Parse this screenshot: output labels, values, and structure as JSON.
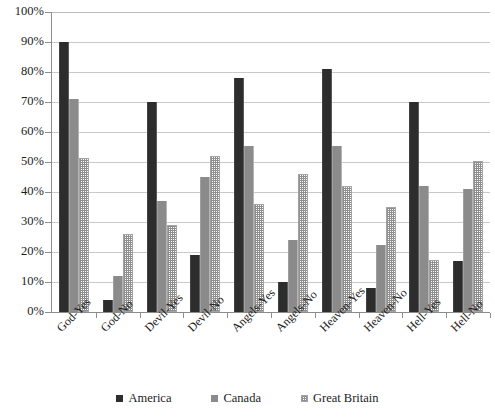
{
  "chart_data": {
    "type": "bar",
    "title": "",
    "subtitle": "",
    "xlabel": "",
    "ylabel": "",
    "ylim": [
      0,
      100
    ],
    "y_unit": "%",
    "grid": true,
    "legend_position": "bottom",
    "categories": [
      "God-Yes",
      "God-No",
      "Devil-Yes",
      "Devil-No",
      "Angels-Yes",
      "Angels-No",
      "Heaven-Yes",
      "Heaven-No",
      "Hell-Yes",
      "Hell-No"
    ],
    "y_ticks": [
      "0%",
      "10%",
      "20%",
      "30%",
      "40%",
      "50%",
      "60%",
      "70%",
      "80%",
      "90%",
      "100%"
    ],
    "y_tick_values": [
      0,
      10,
      20,
      30,
      40,
      50,
      60,
      70,
      80,
      90,
      100
    ],
    "series": [
      {
        "name": "America",
        "color": "#2d2d2d",
        "values": [
          90,
          4,
          70,
          19,
          78,
          10,
          81,
          8,
          70,
          17
        ]
      },
      {
        "name": "Canada",
        "color": "#8b8b8b",
        "values": [
          71,
          12,
          37,
          45,
          55.5,
          24,
          55.5,
          22.5,
          42,
          41
        ]
      },
      {
        "name": "Great Britain",
        "color": "#9e9e9e",
        "values": [
          51.5,
          26,
          29,
          52,
          36,
          46,
          42,
          35,
          17.5,
          50.5
        ]
      }
    ]
  }
}
